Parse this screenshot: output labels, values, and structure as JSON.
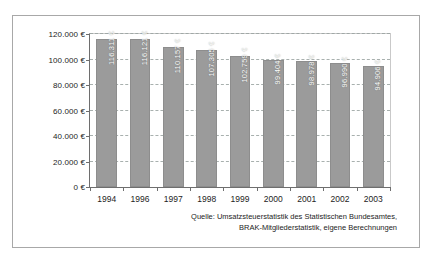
{
  "figure": {
    "source_note_line1": "Quelle: Umsatzsteuerstatistik des Statistischen Bundesamtes,",
    "source_note_line2": "BRAK-Mitgliederstatistik, eigene Berechnungen"
  },
  "colors": {
    "bar_fill": "#9b9b9b",
    "bar_stroke": "#8d8d8d",
    "gridline": "#9aa3a0",
    "axis": "#6e6e6e",
    "frame": "#a8a8a8",
    "value_label": "#ffffff",
    "text": "#1d1d1d",
    "background": "#ffffff"
  },
  "chart_data": {
    "type": "bar",
    "title": "",
    "subtitle": "",
    "xlabel": "",
    "ylabel": "",
    "categories": [
      "1994",
      "1996",
      "1997",
      "1998",
      "1999",
      "2000",
      "2001",
      "2002",
      "2003"
    ],
    "values": [
      116311,
      116121,
      110157,
      107305,
      102759,
      99404,
      98978,
      96990,
      94906
    ],
    "value_labels": [
      "116.311 €",
      "116.121 €",
      "110.157 €",
      "107.305 €",
      "102.759 €",
      "99.404 €",
      "98.978 €",
      "96.990 €",
      "94.906 €"
    ],
    "ylim": [
      0,
      120000
    ],
    "ytick_values": [
      0,
      20000,
      40000,
      60000,
      80000,
      100000,
      120000
    ],
    "ytick_labels": [
      "0 €",
      "20.000 €",
      "40.000 €",
      "60.000 €",
      "80.000 €",
      "100.000 €",
      "120.000 €"
    ],
    "grid": true,
    "grid_style": "dashed",
    "grid_axis": "y",
    "legend": false,
    "legend_position": "none",
    "annotations": [
      "Quelle: Umsatzsteuerstatistik des Statistischen Bundesamtes,",
      "BRAK-Mitgliederstatistik, eigene Berechnungen"
    ]
  }
}
